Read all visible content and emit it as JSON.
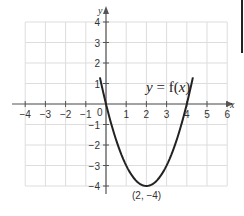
{
  "chart_data": {
    "type": "line",
    "title": "",
    "function_label": "y = f(x)",
    "function_label_parts": {
      "y": "y",
      "eq": " = f(",
      "x": "x",
      "close": ")"
    },
    "xlabel": "x",
    "ylabel": "y",
    "xlim": [
      -4,
      6
    ],
    "ylim": [
      -4,
      4
    ],
    "grid": true,
    "x_ticks": [
      -4,
      -3,
      -2,
      -1,
      1,
      2,
      3,
      4,
      5,
      6
    ],
    "x_tick_labels": [
      "−4",
      "−3",
      "−2",
      "−1",
      "1",
      "2",
      "3",
      "4",
      "5",
      "6"
    ],
    "y_ticks": [
      4,
      3,
      2,
      1,
      -1,
      -2,
      -3,
      -4
    ],
    "y_tick_labels": [
      "4",
      "3",
      "2",
      "1",
      "−1",
      "−2",
      "−3",
      "−4"
    ],
    "origin_label": "0",
    "series": [
      {
        "name": "f(x)",
        "expression": "(x - 2)^2 - 4",
        "x": [
          -0.6,
          -0.5,
          0,
          0.5,
          1,
          1.5,
          2,
          2.5,
          3,
          3.5,
          4,
          4.5,
          4.6
        ],
        "y": [
          2.76,
          2.25,
          0,
          -1.75,
          -3,
          -3.75,
          -4,
          -3.75,
          -3,
          -1.75,
          0,
          2.25,
          2.76
        ],
        "visible_y_clip": [
          -4,
          1.3
        ]
      }
    ],
    "annotations": [
      {
        "text": "(2, −4)",
        "x": 2,
        "y": -4,
        "position": "below"
      }
    ],
    "colors": {
      "curve": "#222222",
      "axis": "#555555",
      "grid": "#dddddd"
    }
  },
  "labels": {
    "vertex": "(2, −4)",
    "origin": "0",
    "x_axis": "x",
    "y_axis": "y"
  }
}
